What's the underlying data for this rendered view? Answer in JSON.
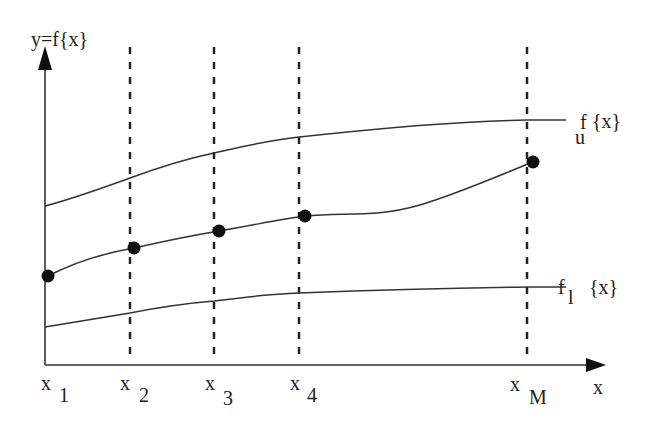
{
  "diagram": {
    "y_axis_label": "y=f{x}",
    "x_axis_label": "x",
    "curves": {
      "upper": {
        "label_main": "f",
        "label_sub": "u",
        "label_arg": "{x}"
      },
      "lower": {
        "label_main": "f",
        "label_sub": "l",
        "label_arg": "{x}"
      }
    },
    "ticks": [
      {
        "main": "x",
        "sub": "1"
      },
      {
        "main": "x",
        "sub": "2"
      },
      {
        "main": "x",
        "sub": "3"
      },
      {
        "main": "x",
        "sub": "4"
      },
      {
        "main": "x",
        "sub": "M"
      }
    ],
    "colors": {
      "line": "#333333",
      "dot": "#111111",
      "background": "#ffffff"
    }
  }
}
